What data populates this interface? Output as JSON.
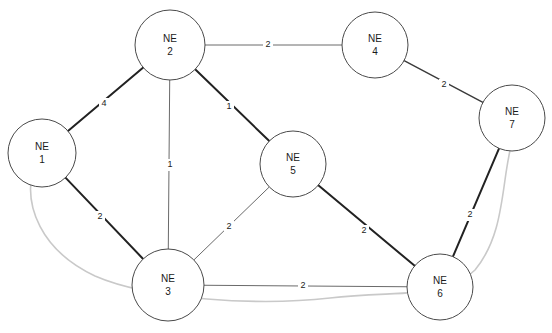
{
  "diagram": {
    "background_color": "#ffffff",
    "node_stroke_color": "#4a4a4a",
    "edge_color": "#2b2b2b",
    "overlay_color": "#c9c9c9",
    "width": 552,
    "height": 333
  },
  "nodes": [
    {
      "id": "NE1",
      "line1": "NE",
      "line2": "1",
      "cx": 42,
      "cy": 153,
      "r": 34
    },
    {
      "id": "NE2",
      "line1": "NE",
      "line2": "2",
      "cx": 170,
      "cy": 45,
      "r": 35
    },
    {
      "id": "NE3",
      "line1": "NE",
      "line2": "3",
      "cx": 168,
      "cy": 285,
      "r": 36
    },
    {
      "id": "NE4",
      "line1": "NE",
      "line2": "4",
      "cx": 375,
      "cy": 45,
      "r": 33
    },
    {
      "id": "NE5",
      "line1": "NE",
      "line2": "5",
      "cx": 293,
      "cy": 164,
      "r": 33
    },
    {
      "id": "NE6",
      "line1": "NE",
      "line2": "6",
      "cx": 440,
      "cy": 287,
      "r": 33
    },
    {
      "id": "NE7",
      "line1": "NE",
      "line2": "7",
      "cx": 512,
      "cy": 118,
      "r": 33
    }
  ],
  "edges": [
    {
      "from": "NE2",
      "to": "NE4",
      "weight": "2",
      "lx": 268,
      "ly": 45,
      "weight_style": "thin"
    },
    {
      "from": "NE2",
      "to": "NE1",
      "weight": "4",
      "lx": 104,
      "ly": 104,
      "weight_style": "thick"
    },
    {
      "from": "NE2",
      "to": "NE3",
      "weight": "1",
      "lx": 170,
      "ly": 165,
      "weight_style": "thin"
    },
    {
      "from": "NE2",
      "to": "NE5",
      "weight": "1",
      "lx": 229,
      "ly": 107,
      "weight_style": "thick"
    },
    {
      "from": "NE4",
      "to": "NE7",
      "weight": "2",
      "lx": 444,
      "ly": 85,
      "weight_style": "medium"
    },
    {
      "from": "NE1",
      "to": "NE3",
      "weight": "2",
      "lx": 100,
      "ly": 217,
      "weight_style": "thick"
    },
    {
      "from": "NE3",
      "to": "NE5",
      "weight": "2",
      "lx": 229,
      "ly": 227,
      "weight_style": "thin"
    },
    {
      "from": "NE3",
      "to": "NE6",
      "weight": "2",
      "lx": 303,
      "ly": 286,
      "weight_style": "thin"
    },
    {
      "from": "NE5",
      "to": "NE6",
      "weight": "2",
      "lx": 364,
      "ly": 231,
      "weight_style": "thick"
    },
    {
      "from": "NE7",
      "to": "NE6",
      "weight": "2",
      "lx": 470,
      "ly": 215,
      "weight_style": "thick"
    }
  ],
  "overlay_links": [
    {
      "name": "ne1-ne6-ne7-protection-path",
      "d": "M 33 170 C 24 205, 40 250, 95 276 C 150 300, 260 306, 330 298 C 400 290, 445 300, 475 270 C 508 230, 500 175, 515 131"
    }
  ]
}
